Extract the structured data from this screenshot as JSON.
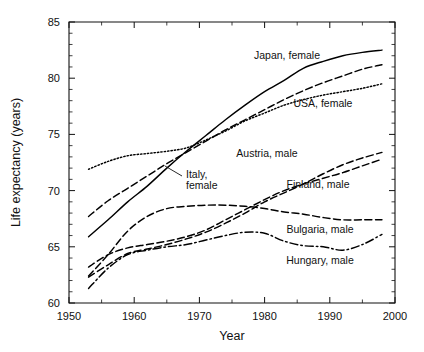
{
  "chart_data": {
    "type": "line",
    "title": "",
    "xlabel": "Year",
    "ylabel": "Life expectancy (years)",
    "xlim": [
      1950,
      2000
    ],
    "ylim": [
      60,
      85
    ],
    "xticks": [
      1950,
      1960,
      1970,
      1980,
      1990,
      2000
    ],
    "xtick_labels": [
      "1950",
      "1960",
      "1970",
      "1980",
      "1990",
      "2000"
    ],
    "xticks_minor_step": 5,
    "yticks": [
      60,
      65,
      70,
      75,
      80,
      85
    ],
    "ytick_labels": [
      "60",
      "65",
      "70",
      "75",
      "80",
      "85"
    ],
    "yticks_minor_step": 1,
    "grid": false,
    "legend_position": "inline-annotations",
    "series": [
      {
        "name": "Japan, female",
        "label": "Japan, female",
        "style": "solid",
        "label_x": 287,
        "label_y": 59,
        "x": [
          1953,
          1956,
          1959,
          1962,
          1965,
          1968,
          1971,
          1974,
          1977,
          1980,
          1983,
          1986,
          1989,
          1992,
          1995,
          1998
        ],
        "y": [
          65.9,
          67.4,
          69.0,
          70.4,
          72.0,
          73.5,
          74.9,
          76.3,
          77.6,
          78.8,
          79.8,
          80.9,
          81.5,
          82.0,
          82.3,
          82.5
        ]
      },
      {
        "name": "Italy, female",
        "label": "Italy, female",
        "style": "dashed",
        "label_x": 186,
        "label_y": 178,
        "leader_from_x": 182,
        "leader_from_y": 176,
        "leader_to_x": 165,
        "leader_to_y": 166,
        "x": [
          1953,
          1956,
          1959,
          1962,
          1965,
          1968,
          1971,
          1974,
          1977,
          1980,
          1983,
          1986,
          1989,
          1992,
          1995,
          1998
        ],
        "y": [
          67.7,
          69.1,
          70.2,
          71.3,
          72.4,
          73.4,
          74.4,
          75.4,
          76.3,
          77.2,
          78.1,
          78.9,
          79.6,
          80.2,
          80.8,
          81.2
        ]
      },
      {
        "name": "USA, female",
        "label": "USA, female",
        "style": "dotted",
        "label_x": 323,
        "label_y": 107,
        "x": [
          1953,
          1956,
          1959,
          1962,
          1965,
          1968,
          1971,
          1974,
          1977,
          1980,
          1983,
          1986,
          1989,
          1992,
          1995,
          1998
        ],
        "y": [
          71.9,
          72.6,
          73.1,
          73.3,
          73.5,
          73.8,
          74.5,
          75.3,
          76.2,
          76.9,
          77.6,
          78.1,
          78.5,
          78.8,
          79.1,
          79.5
        ]
      },
      {
        "name": "Austria, male",
        "label": "Austria, male",
        "style": "dashed",
        "label_x": 267,
        "label_y": 157,
        "x": [
          1953,
          1956,
          1959,
          1962,
          1965,
          1968,
          1971,
          1974,
          1977,
          1980,
          1983,
          1986,
          1989,
          1992,
          1995,
          1998
        ],
        "y": [
          62.3,
          63.4,
          64.4,
          64.8,
          65.2,
          65.7,
          66.3,
          67.1,
          68.0,
          69.0,
          69.8,
          70.6,
          71.5,
          72.3,
          72.9,
          73.4
        ]
      },
      {
        "name": "Finland, male",
        "label": "Finland, male",
        "style": "dashed",
        "label_x": 318,
        "label_y": 188,
        "x": [
          1953,
          1956,
          1959,
          1962,
          1965,
          1968,
          1971,
          1974,
          1977,
          1980,
          1983,
          1986,
          1989,
          1992,
          1995,
          1998
        ],
        "y": [
          63.2,
          64.3,
          64.9,
          65.2,
          65.5,
          65.9,
          66.5,
          67.4,
          68.3,
          69.2,
          70.0,
          70.6,
          71.1,
          71.6,
          72.2,
          72.8
        ]
      },
      {
        "name": "Bulgaria, male",
        "label": "Bulgaria, male",
        "style": "dashed",
        "label_x": 320,
        "label_y": 233,
        "x": [
          1953,
          1956,
          1959,
          1962,
          1965,
          1968,
          1971,
          1974,
          1977,
          1980,
          1983,
          1986,
          1989,
          1992,
          1995,
          1998
        ],
        "y": [
          62.4,
          64.3,
          66.4,
          67.7,
          68.4,
          68.6,
          68.7,
          68.7,
          68.6,
          68.4,
          68.1,
          67.9,
          67.6,
          67.4,
          67.4,
          67.4
        ]
      },
      {
        "name": "Hungary, male",
        "label": "Hungary, male",
        "style": "dashdot",
        "label_x": 320,
        "label_y": 264,
        "x": [
          1953,
          1956,
          1959,
          1962,
          1965,
          1968,
          1971,
          1974,
          1977,
          1980,
          1983,
          1986,
          1989,
          1992,
          1995,
          1998
        ],
        "y": [
          61.3,
          63.1,
          64.3,
          64.7,
          65.0,
          65.2,
          65.6,
          66.0,
          66.3,
          66.2,
          65.5,
          65.1,
          65.0,
          64.7,
          65.2,
          66.1
        ]
      }
    ]
  },
  "plot_box": {
    "left": 69,
    "right": 395,
    "top": 22,
    "bottom": 303
  }
}
